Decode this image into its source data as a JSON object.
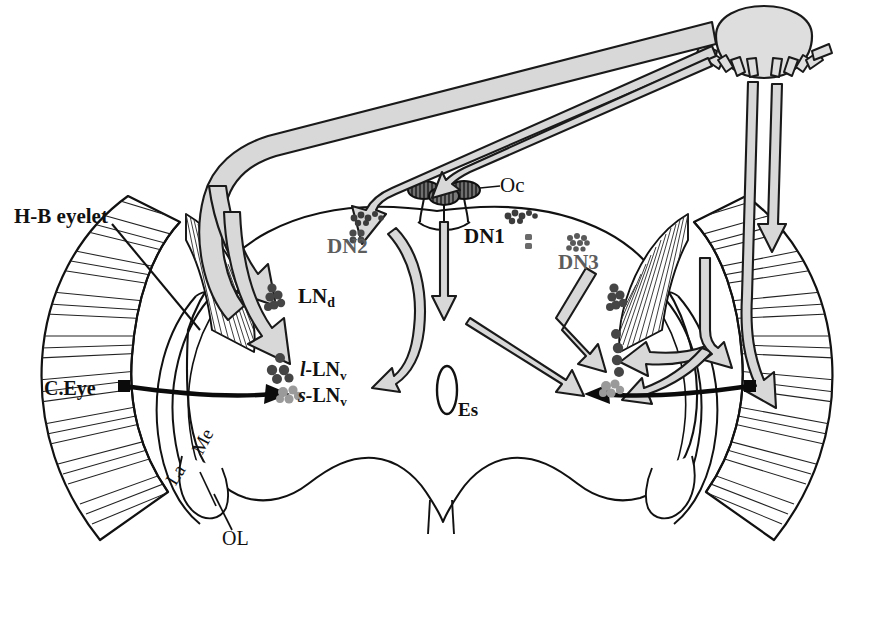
{
  "figure": {
    "background_color": "#ffffff",
    "line_color": "#111111",
    "arrow_fill": "#d8d8d8",
    "arrow_stroke": "#1a1a1a",
    "cell_dark": "#4a4a4a",
    "cell_mid": "#5a5a5a",
    "cell_light": "#9a9a9a",
    "gray_text": "#5d5d5d"
  },
  "labels": {
    "hb_eyelet": "H-B eyelet",
    "compound_eye": "C.Eye",
    "medulla": "Me",
    "lamina": "La",
    "optic_lobe": "OL",
    "ocelli": "Oc",
    "dn1": "DN1",
    "dn2": "DN2",
    "dn3": "DN3",
    "lnd_main": "LN",
    "lnd_sub": "d",
    "l_lnv_prefix": "l-",
    "l_lnv_main": "LN",
    "l_lnv_sub": "v",
    "s_lnv_prefix": "s-",
    "s_lnv_main": "LN",
    "s_lnv_sub": "v",
    "esophagus": "Es"
  },
  "structures": [
    {
      "name": "sun",
      "label": "",
      "description": "light source with radiating rays, top right"
    },
    {
      "name": "left-compound-eye",
      "label": "C.Eye",
      "description": "radially hatched crescent, left"
    },
    {
      "name": "right-compound-eye",
      "label": "C.Eye",
      "description": "radially hatched crescent, right"
    },
    {
      "name": "left-hb-eyelet",
      "label": "H-B eyelet",
      "description": "small hatched wedge behind left eye"
    },
    {
      "name": "right-hb-eyelet",
      "label": "H-B eyelet",
      "description": "small hatched wedge behind right eye"
    },
    {
      "name": "ocelli",
      "label": "Oc",
      "description": "three hatched ovals on dorsal midline"
    },
    {
      "name": "esophagus",
      "label": "Es",
      "description": "central vertical oval"
    },
    {
      "name": "left-optic-lobe",
      "label": "OL",
      "description": "lamina and medulla crescents, left"
    },
    {
      "name": "right-optic-lobe",
      "label": "OL",
      "description": "lamina and medulla crescents, right"
    }
  ],
  "neuron_groups": [
    {
      "name": "DN1",
      "label": "DN1",
      "color": "#1a1a1a",
      "side": "both",
      "count_dots": 9
    },
    {
      "name": "DN2",
      "label": "DN2",
      "color": "#5d5d5d",
      "side": "left",
      "count_dots": 4
    },
    {
      "name": "DN3",
      "label": "DN3",
      "color": "#5d5d5d",
      "side": "right",
      "count_dots": 12
    },
    {
      "name": "LNd",
      "label": "LNd",
      "color": "#1a1a1a",
      "side": "both",
      "count_dots": 6
    },
    {
      "name": "l-LNv",
      "label": "l-LNv",
      "color": "#1a1a1a",
      "side": "both",
      "count_dots": 5
    },
    {
      "name": "s-LNv",
      "label": "s-LNv",
      "color": "#1a1a1a",
      "side": "both",
      "count_dots": 5
    }
  ]
}
